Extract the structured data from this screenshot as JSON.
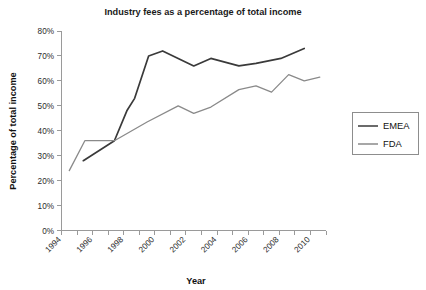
{
  "chart_data": {
    "type": "line",
    "title": "Industry fees as a percentage of total income",
    "xlabel": "Year",
    "ylabel": "Percentage of total income",
    "xlim": [
      1994,
      2011
    ],
    "ylim": [
      0,
      80
    ],
    "grid": false,
    "legend_position": "right",
    "x_tick_labels": [
      "1994",
      "1996",
      "1998",
      "2000",
      "2002",
      "2004",
      "2006",
      "2008",
      "2010"
    ],
    "x_tick_values": [
      1994,
      1996,
      1998,
      2000,
      2002,
      2004,
      2006,
      2008,
      2010
    ],
    "x_minor_tick_values": [
      1995,
      1997,
      1999,
      2001,
      2003,
      2005,
      2007,
      2009,
      2011
    ],
    "y_tick_labels": [
      "0%",
      "10%",
      "20%",
      "30%",
      "40%",
      "50%",
      "60%",
      "70%",
      "80%"
    ],
    "y_tick_values": [
      0,
      10,
      20,
      30,
      40,
      50,
      60,
      70,
      80
    ],
    "series": [
      {
        "name": "EMEA",
        "color": "#3a3a3a",
        "x": [
          1995.4,
          1997.4,
          1998.2,
          1998.7,
          1999.6,
          2000.5,
          2002.5,
          2003.6,
          2005.4,
          2006.5,
          2008.1,
          2009.6
        ],
        "values": [
          28,
          36,
          48,
          53,
          70,
          72,
          66,
          69,
          66,
          67,
          69,
          73
        ]
      },
      {
        "name": "FDA",
        "color": "#8a8a8a",
        "x": [
          1994.5,
          1995.5,
          1997.4,
          1999.5,
          2001.5,
          2002.5,
          2003.6,
          2005.4,
          2006.5,
          2007.5,
          2008.6,
          2009.6,
          2010.6
        ],
        "values": [
          24,
          36,
          36,
          43.5,
          50,
          47,
          49.5,
          56.5,
          58,
          55.5,
          62.5,
          60,
          61.5
        ]
      }
    ]
  },
  "legend": {
    "items": [
      {
        "label": "EMEA",
        "color": "#3a3a3a"
      },
      {
        "label": "FDA",
        "color": "#8a8a8a"
      }
    ]
  }
}
